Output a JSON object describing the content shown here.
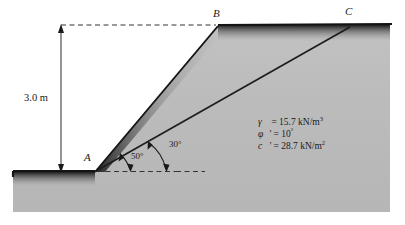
{
  "figure": {
    "colors": {
      "soil_fill": "#b4b4b4",
      "soil_fill_light": "#c8c8c8",
      "line": "#1a1a1a",
      "background": "#ffffff"
    }
  },
  "points": [
    {
      "id": "A",
      "label": "A",
      "x": 95,
      "y": 172
    },
    {
      "id": "B",
      "label": "B",
      "x": 218,
      "y": 26
    },
    {
      "id": "C",
      "label": "C",
      "x": 350,
      "y": 27
    }
  ],
  "dimension": {
    "height_label": "3.0 m",
    "value": 3.0,
    "unit": "m"
  },
  "angles": [
    {
      "label": "50°",
      "value": 50,
      "unit": "degrees",
      "at": "slope-face-AB"
    },
    {
      "label": "30°",
      "value": 30,
      "unit": "degrees",
      "at": "failure-plane-AC"
    }
  ],
  "parameters": [
    {
      "symbol": "γ",
      "prime": "",
      "equals": "=",
      "value": "15.7 kN/m",
      "exponent": "3"
    },
    {
      "symbol": "φ",
      "prime": "′",
      "equals": "=",
      "value": "10",
      "exponent": "°"
    },
    {
      "symbol": "c",
      "prime": "′",
      "equals": "=",
      "value": "28.7 kN/m",
      "exponent": "2"
    }
  ]
}
